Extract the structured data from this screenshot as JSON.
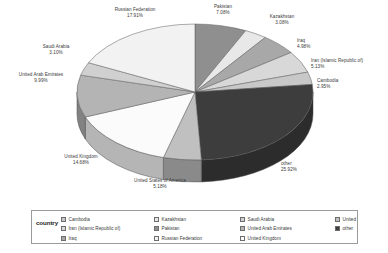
{
  "chart_data": {
    "type": "pie",
    "title": "",
    "legend_title": "country",
    "legend_position": "bottom",
    "three_d": true,
    "categories": [
      "Pakistan",
      "Kazakhstan",
      "Iraq",
      "Iran (Islamic Republic of)",
      "Cambodia",
      "other",
      "United States of America",
      "United Kingdom",
      "United Arab Emirates",
      "Saudi Arabia",
      "Russian Federation"
    ],
    "values": [
      7.08,
      3.08,
      4.98,
      5.13,
      2.95,
      25.92,
      5.18,
      14.68,
      9.99,
      3.1,
      17.91
    ],
    "value_unit": "%",
    "labels": [
      {
        "name": "Pakistan",
        "pct": "7.08%"
      },
      {
        "name": "Kazakhstan",
        "pct": "3.08%"
      },
      {
        "name": "Iraq",
        "pct": "4.98%"
      },
      {
        "name": "Iran (Islamic Republic of)",
        "pct": "5.13%"
      },
      {
        "name": "Cambodia",
        "pct": "2.95%"
      },
      {
        "name": "other",
        "pct": "25.92%"
      },
      {
        "name": "United States of America",
        "pct": "5.18%"
      },
      {
        "name": "United Kingdom",
        "pct": "14.68%"
      },
      {
        "name": "United Arab Emirates",
        "pct": "9.99%"
      },
      {
        "name": "Saudi Arabia",
        "pct": "3.10%"
      },
      {
        "name": "Russian Federation",
        "pct": "17.91%"
      }
    ],
    "colors": {
      "Pakistan": "#8f8f8f",
      "Kazakhstan": "#e8e8e8",
      "Iraq": "#a8a8a8",
      "Iran (Islamic Republic of)": "#d8d8d8",
      "Cambodia": "#c8c8c8",
      "other": "#3d3d3d",
      "United States of America": "#c0c0c0",
      "United Kingdom": "#fbfbfb",
      "United Arab Emirates": "#b4b4b4",
      "Saudi Arabia": "#d0d0d0",
      "Russian Federation": "#f2f2f2"
    }
  },
  "legend": {
    "title": "country",
    "entries": [
      {
        "label": "Cambodia",
        "color": "#c8c8c8"
      },
      {
        "label": "Iran (Islamic Republic of)",
        "color": "#d8d8d8"
      },
      {
        "label": "Iraq",
        "color": "#a8a8a8"
      },
      {
        "label": "Kazakhstan",
        "color": "#e8e8e8"
      },
      {
        "label": "Pakistan",
        "color": "#8f8f8f"
      },
      {
        "label": "Russian Federation",
        "color": "#f2f2f2"
      },
      {
        "label": "Saudi Arabia",
        "color": "#d0d0d0"
      },
      {
        "label": "United Arab Emirates",
        "color": "#b4b4b4"
      },
      {
        "label": "United Kingdom",
        "color": "#fbfbfb"
      },
      {
        "label": "United States of America",
        "color": "#c0c0c0"
      },
      {
        "label": "other",
        "color": "#3d3d3d"
      }
    ]
  }
}
